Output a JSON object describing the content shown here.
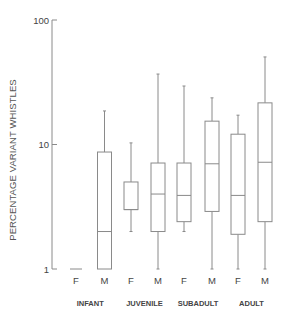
{
  "chart_data": {
    "type": "box",
    "title": "",
    "xlabel": "",
    "ylabel": "PERCENTAGE VARIANT WHISTLES",
    "yscale": "log",
    "ylim": [
      1,
      100
    ],
    "yticks": [
      1,
      10,
      100
    ],
    "ytick_labels": [
      "1",
      "10",
      "100"
    ],
    "grid": false,
    "legend": null,
    "groups": [
      "INFANT",
      "JUVENILE",
      "SUBADULT",
      "ADULT"
    ],
    "categories": [
      "F",
      "M",
      "F",
      "M",
      "F",
      "M",
      "F",
      "M"
    ],
    "series": [
      {
        "group": "INFANT",
        "sex": "F",
        "min": 1.0,
        "q1": 1.0,
        "median": 1.0,
        "q3": 1.0,
        "max": 1.0
      },
      {
        "group": "INFANT",
        "sex": "M",
        "min": 1.0,
        "q1": 1.0,
        "median": 2.0,
        "q3": 8.7,
        "max": 18.6
      },
      {
        "group": "JUVENILE",
        "sex": "F",
        "min": 2.0,
        "q1": 3.0,
        "median": 3.0,
        "q3": 5.0,
        "max": 10.3
      },
      {
        "group": "JUVENILE",
        "sex": "M",
        "min": 1.0,
        "q1": 2.0,
        "median": 4.0,
        "q3": 7.1,
        "max": 36.8
      },
      {
        "group": "SUBADULT",
        "sex": "F",
        "min": 2.0,
        "q1": 2.4,
        "median": 3.9,
        "q3": 7.1,
        "max": 29.5
      },
      {
        "group": "SUBADULT",
        "sex": "M",
        "min": 1.0,
        "q1": 2.9,
        "median": 7.0,
        "q3": 15.4,
        "max": 23.7
      },
      {
        "group": "ADULT",
        "sex": "F",
        "min": 1.0,
        "q1": 1.9,
        "median": 3.9,
        "q3": 12.1,
        "max": 17.2
      },
      {
        "group": "ADULT",
        "sex": "M",
        "min": 1.0,
        "q1": 2.4,
        "median": 7.2,
        "q3": 21.6,
        "max": 50.5
      }
    ]
  },
  "labels": {
    "ylabel": "PERCENTAGE VARIANT WHISTLES"
  },
  "colors": {
    "line": "#8a8a8a",
    "text": "#444444"
  }
}
